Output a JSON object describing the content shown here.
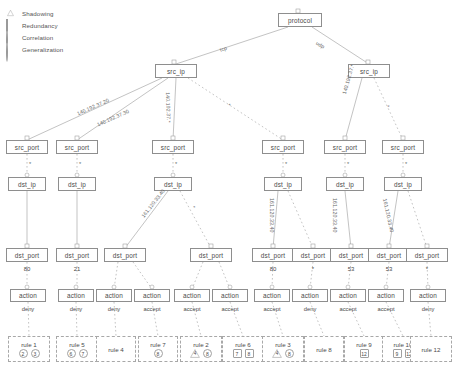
{
  "legend": {
    "items": [
      {
        "label": "Shadowing",
        "glyph": "triangle-icon"
      },
      {
        "label": "Redundancy",
        "glyph": "square-icon"
      },
      {
        "label": "Correlation",
        "glyph": "circle-icon"
      },
      {
        "label": "Generalization",
        "glyph": "circle-icon"
      }
    ]
  },
  "nodes": {
    "root": {
      "label": "protocol"
    },
    "src_ip": {
      "label": "src_ip"
    },
    "src_port": {
      "label": "src_port"
    },
    "dst_ip": {
      "label": "dst_ip"
    },
    "dst_port": {
      "label": "dst_port"
    },
    "action": {
      "label": "action"
    }
  },
  "tree": {
    "level_protocol": [
      {
        "id": "protocol",
        "label": "protocol",
        "x": 278,
        "y": 13,
        "w": 44,
        "h": 14
      }
    ],
    "level_src_ip": [
      {
        "id": "srcip-left",
        "label": "src_ip",
        "x": 155,
        "y": 64,
        "w": 42,
        "h": 14
      },
      {
        "id": "srcip-right",
        "label": "src_ip",
        "x": 348,
        "y": 64,
        "w": 42,
        "h": 14
      }
    ],
    "level_src_port": [
      {
        "id": "sp1",
        "label": "src_port",
        "x": 6,
        "y": 140,
        "w": 42,
        "h": 14
      },
      {
        "id": "sp2",
        "label": "src_port",
        "x": 56,
        "y": 140,
        "w": 42,
        "h": 14
      },
      {
        "id": "sp3",
        "label": "src_port",
        "x": 152,
        "y": 140,
        "w": 42,
        "h": 14
      },
      {
        "id": "sp4",
        "label": "src_port",
        "x": 262,
        "y": 140,
        "w": 42,
        "h": 14
      },
      {
        "id": "sp5",
        "label": "src_port",
        "x": 324,
        "y": 140,
        "w": 42,
        "h": 14
      },
      {
        "id": "sp6",
        "label": "src_port",
        "x": 382,
        "y": 140,
        "w": 42,
        "h": 14
      }
    ],
    "level_dst_ip": [
      {
        "id": "di1",
        "label": "dst_ip",
        "x": 8,
        "y": 177,
        "w": 38,
        "h": 14
      },
      {
        "id": "di2",
        "label": "dst_ip",
        "x": 58,
        "y": 177,
        "w": 38,
        "h": 14
      },
      {
        "id": "di3",
        "label": "dst_ip",
        "x": 154,
        "y": 177,
        "w": 38,
        "h": 14
      },
      {
        "id": "di4",
        "label": "dst_ip",
        "x": 264,
        "y": 177,
        "w": 38,
        "h": 14
      },
      {
        "id": "di5",
        "label": "dst_ip",
        "x": 326,
        "y": 177,
        "w": 38,
        "h": 14
      },
      {
        "id": "di6",
        "label": "dst_ip",
        "x": 384,
        "y": 177,
        "w": 38,
        "h": 14
      }
    ],
    "level_dst_port": [
      {
        "id": "dp1",
        "label": "dst_port",
        "x": 6,
        "y": 248,
        "w": 42,
        "h": 14,
        "port": "80"
      },
      {
        "id": "dp2",
        "label": "dst_port",
        "x": 56,
        "y": 248,
        "w": 42,
        "h": 14,
        "port": "21"
      },
      {
        "id": "dp3",
        "label": "dst_port",
        "x": 104,
        "y": 248,
        "w": 42,
        "h": 14,
        "port": ""
      },
      {
        "id": "dp4",
        "label": "dst_port",
        "x": 190,
        "y": 248,
        "w": 42,
        "h": 14,
        "port": ""
      },
      {
        "id": "dp5",
        "label": "dst_port",
        "x": 252,
        "y": 248,
        "w": 42,
        "h": 14,
        "port": "80"
      },
      {
        "id": "dp6",
        "label": "dst_port",
        "x": 292,
        "y": 248,
        "w": 42,
        "h": 14,
        "port": "*"
      },
      {
        "id": "dp7",
        "label": "dst_port",
        "x": 330,
        "y": 248,
        "w": 42,
        "h": 14,
        "port": "53"
      },
      {
        "id": "dp8",
        "label": "dst_port",
        "x": 368,
        "y": 248,
        "w": 42,
        "h": 14,
        "port": "53"
      },
      {
        "id": "dp9",
        "label": "dst_port",
        "x": 406,
        "y": 248,
        "w": 42,
        "h": 14,
        "port": "*"
      }
    ],
    "level_action": [
      {
        "id": "ac1",
        "label": "action",
        "x": 10,
        "y": 289,
        "w": 36,
        "h": 13,
        "value": "deny"
      },
      {
        "id": "ac2",
        "label": "action",
        "x": 58,
        "y": 289,
        "w": 36,
        "h": 13,
        "value": "deny"
      },
      {
        "id": "ac3",
        "label": "action",
        "x": 96,
        "y": 289,
        "w": 36,
        "h": 13,
        "value": "deny"
      },
      {
        "id": "ac4",
        "label": "action",
        "x": 134,
        "y": 289,
        "w": 36,
        "h": 13,
        "value": "accept"
      },
      {
        "id": "ac5",
        "label": "action",
        "x": 174,
        "y": 289,
        "w": 36,
        "h": 13,
        "value": "accept"
      },
      {
        "id": "ac6",
        "label": "action",
        "x": 212,
        "y": 289,
        "w": 36,
        "h": 13,
        "value": "accept"
      },
      {
        "id": "ac7",
        "label": "action",
        "x": 254,
        "y": 289,
        "w": 36,
        "h": 13,
        "value": "accept"
      },
      {
        "id": "ac8",
        "label": "action",
        "x": 292,
        "y": 289,
        "w": 36,
        "h": 13,
        "value": "deny"
      },
      {
        "id": "ac9",
        "label": "action",
        "x": 330,
        "y": 289,
        "w": 36,
        "h": 13,
        "value": "accept"
      },
      {
        "id": "ac10",
        "label": "action",
        "x": 368,
        "y": 289,
        "w": 36,
        "h": 13,
        "value": "accept"
      },
      {
        "id": "ac11",
        "label": "action",
        "x": 410,
        "y": 289,
        "w": 36,
        "h": 13,
        "value": "deny"
      }
    ],
    "level_rules": [
      {
        "id": "r1",
        "title": "rule 1",
        "x": 8,
        "y": 336,
        "w": 42,
        "h": 26,
        "badges": [
          {
            "text": "2",
            "shape": "circle"
          },
          {
            "text": "3",
            "shape": "circle"
          }
        ]
      },
      {
        "id": "r5",
        "title": "rule 5",
        "x": 56,
        "y": 336,
        "w": 42,
        "h": 26,
        "badges": [
          {
            "text": "6",
            "shape": "circle"
          },
          {
            "text": "7",
            "shape": "circle"
          }
        ]
      },
      {
        "id": "r4",
        "title": "rule 4",
        "x": 96,
        "y": 336,
        "w": 40,
        "h": 26,
        "badges": []
      },
      {
        "id": "r7",
        "title": "rule 7",
        "x": 138,
        "y": 336,
        "w": 40,
        "h": 26,
        "badges": [
          {
            "text": "8",
            "shape": "circle"
          }
        ]
      },
      {
        "id": "r2",
        "title": "rule 2",
        "x": 180,
        "y": 336,
        "w": 42,
        "h": 26,
        "badges": [
          {
            "text": "4",
            "shape": "tri"
          },
          {
            "text": "8",
            "shape": "circle"
          }
        ]
      },
      {
        "id": "r6",
        "title": "rule 6",
        "x": 222,
        "y": 336,
        "w": 42,
        "h": 26,
        "badges": [
          {
            "text": "7",
            "shape": "square"
          },
          {
            "text": "8",
            "shape": "square"
          }
        ]
      },
      {
        "id": "r3",
        "title": "rule 3",
        "x": 262,
        "y": 336,
        "w": 42,
        "h": 26,
        "badges": [
          {
            "text": "4",
            "shape": "tri"
          },
          {
            "text": "8",
            "shape": "circle"
          }
        ]
      },
      {
        "id": "r8",
        "title": "rule 8",
        "x": 304,
        "y": 336,
        "w": 40,
        "h": 26,
        "badges": []
      },
      {
        "id": "r9",
        "title": "rule 9",
        "x": 344,
        "y": 336,
        "w": 40,
        "h": 26,
        "badges": [
          {
            "text": "12",
            "shape": "square"
          }
        ]
      },
      {
        "id": "r10",
        "title": "rule 10",
        "x": 382,
        "y": 336,
        "w": 42,
        "h": 26,
        "badges": [
          {
            "text": "9",
            "shape": "square"
          },
          {
            "text": "12",
            "shape": "square"
          }
        ]
      },
      {
        "id": "r12",
        "title": "rule 12",
        "x": 410,
        "y": 336,
        "w": 42,
        "h": 26,
        "badges": []
      }
    ]
  },
  "edge_labels": {
    "protocol_tcp": "tcp",
    "protocol_udp": "udp",
    "srcip_left_a": "140.192.37.20",
    "srcip_left_b": "140.192.37.30",
    "srcip_left_c": "140.192.37.*",
    "srcip_left_d": "*",
    "srcip_right_a": "140.192.37.*",
    "srcip_right_b": "*",
    "srcport_star": "*",
    "dstip_a": "161.120.33.40",
    "dstip_b": "*",
    "dstip_c": "161.120.33.40",
    "dstip_d": "161.120.33.40",
    "dstip_e": "161.120.33.40"
  },
  "colors": {
    "node_border": "#8e8e8e",
    "dashed_border": "#a8a8a8",
    "text": "#4a4a4a",
    "edge": "#9a9a9a",
    "background": "#ffffff"
  }
}
